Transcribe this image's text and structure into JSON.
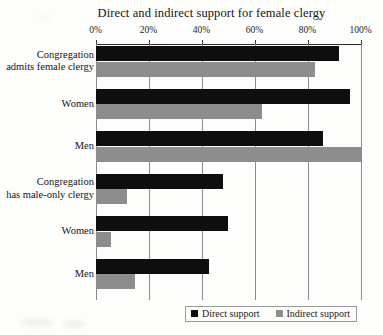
{
  "chart_data": {
    "type": "bar",
    "orientation": "horizontal",
    "title": "Direct and indirect support for female clergy",
    "xlabel": "",
    "ylabel": "",
    "xlim": [
      0,
      100
    ],
    "grid": true,
    "legend_position": "bottom",
    "tick_labels": [
      "0%",
      "20%",
      "40%",
      "60%",
      "80%",
      "100%"
    ],
    "tick_values": [
      0,
      20,
      40,
      60,
      80,
      100
    ],
    "categories": [
      "Congregation admits female clergy",
      "Women",
      "Men",
      "Congregation has male-only clergy",
      "Women",
      "Men"
    ],
    "category_lines": [
      [
        "Congregation",
        "admits female clergy"
      ],
      [
        "Women"
      ],
      [
        "Men"
      ],
      [
        "Congregation",
        "has male-only clergy"
      ],
      [
        "Women"
      ],
      [
        "Men"
      ]
    ],
    "series": [
      {
        "name": "Direct support",
        "color": "#0e0e0e",
        "values": [
          92,
          96,
          86,
          48,
          50,
          43
        ]
      },
      {
        "name": "Indirect support",
        "color": "#8d8d8d",
        "values": [
          83,
          63,
          100,
          12,
          6,
          15
        ]
      }
    ]
  },
  "legend": {
    "items": [
      {
        "label": "Direct support",
        "swatch": "direct"
      },
      {
        "label": "Indirect support",
        "swatch": "indirect"
      }
    ]
  }
}
